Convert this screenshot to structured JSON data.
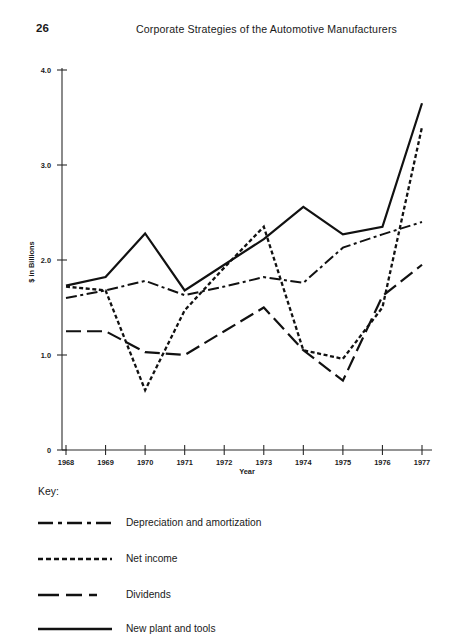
{
  "page": {
    "number": "26",
    "running_head": "Corporate Strategies of the Automotive Manufacturers"
  },
  "key": {
    "title": "Key:",
    "entries": [
      {
        "label": "Depreciation and amortization",
        "style": "dash-dot"
      },
      {
        "label": "Net income",
        "style": "dotted"
      },
      {
        "label": "Dividends",
        "style": "long-dash"
      },
      {
        "label": "New plant and tools",
        "style": "solid"
      }
    ]
  },
  "chart_data": {
    "type": "line",
    "title": "",
    "xlabel": "Year",
    "ylabel": "$ in Billions",
    "grid": false,
    "legend_position": "below",
    "x": [
      "1968",
      "1969",
      "1970",
      "1971",
      "1972",
      "1973",
      "1974",
      "1975",
      "1976",
      "1977"
    ],
    "xlim": [
      1968,
      1977
    ],
    "ylim": [
      0,
      4.0
    ],
    "ytick_labels": [
      "4.0",
      "3.0",
      "2.0",
      "1.0",
      "0"
    ],
    "yticks": [
      4.0,
      3.0,
      2.0,
      1.0,
      0
    ],
    "units": "$ in Billions",
    "series": [
      {
        "name": "Depreciation and amortization",
        "style": "dash-dot",
        "values": [
          1.6,
          1.68,
          1.78,
          1.63,
          1.72,
          1.82,
          1.76,
          2.13,
          2.27,
          2.4
        ]
      },
      {
        "name": "Net income",
        "style": "dotted",
        "values": [
          1.72,
          1.68,
          0.63,
          1.47,
          1.92,
          2.35,
          1.05,
          0.96,
          1.5,
          3.4
        ]
      },
      {
        "name": "Dividends",
        "style": "long-dash",
        "values": [
          1.25,
          1.25,
          1.03,
          1.0,
          1.25,
          1.5,
          1.05,
          0.73,
          1.62,
          1.95
        ]
      },
      {
        "name": "New plant and tools",
        "style": "solid",
        "values": [
          1.73,
          1.82,
          2.28,
          1.68,
          1.95,
          2.22,
          2.56,
          2.27,
          2.35,
          3.65
        ]
      }
    ]
  }
}
